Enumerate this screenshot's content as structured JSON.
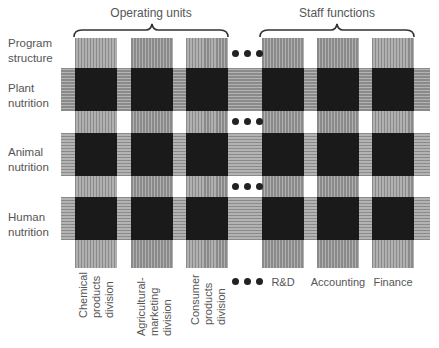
{
  "groups": {
    "operating_units": "Operating units",
    "staff_functions": "Staff functions"
  },
  "row_header": "Program\nstructure",
  "rows": [
    {
      "label": "Plant\nnutrition"
    },
    {
      "label": "Animal\nnutrition"
    },
    {
      "label": "Human\nnutrition"
    }
  ],
  "columns": [
    {
      "label": "Chemical\nproducts\ndivision",
      "group": "operating_units",
      "orientation": "vertical"
    },
    {
      "label": "Agricultural-\nmarketing\ndivision",
      "group": "operating_units",
      "orientation": "vertical"
    },
    {
      "label": "Consumer\nproducts\ndivision",
      "group": "operating_units",
      "orientation": "vertical"
    },
    {
      "label": "R&D",
      "group": "staff_functions",
      "orientation": "horizontal"
    },
    {
      "label": "Accounting",
      "group": "staff_functions",
      "orientation": "horizontal"
    },
    {
      "label": "Finance",
      "group": "staff_functions",
      "orientation": "horizontal"
    }
  ],
  "ellipsis": "•••",
  "colors": {
    "intersection": "#1a1a1a",
    "band": "#9e9e9e",
    "text": "#555555"
  }
}
